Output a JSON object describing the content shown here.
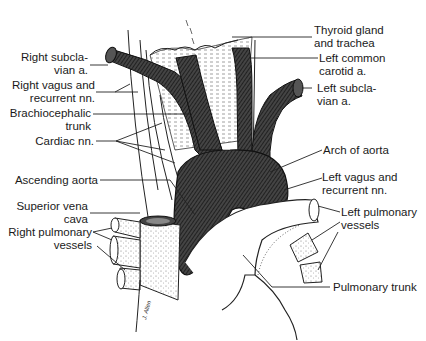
{
  "figure": {
    "colors": {
      "vessel_dark": "#3a3a3a",
      "vessel_hatch": "#1a1a1a",
      "line": "#222222",
      "background": "#ffffff",
      "stipple": "#555555"
    },
    "labels_left": [
      {
        "id": "right-subclavian",
        "lines": [
          "Right subcla-",
          "vian a."
        ]
      },
      {
        "id": "right-vagus",
        "lines": [
          "Right vagus and",
          "recurrent nn."
        ]
      },
      {
        "id": "brachiocephalic",
        "lines": [
          "Brachiocephalic",
          "trunk"
        ]
      },
      {
        "id": "cardiac",
        "lines": [
          "Cardiac nn."
        ]
      },
      {
        "id": "ascending-aorta",
        "lines": [
          "Ascending aorta"
        ]
      },
      {
        "id": "svc",
        "lines": [
          "Superior vena",
          "cava"
        ]
      },
      {
        "id": "right-pulmonary",
        "lines": [
          "Right pulmonary",
          "vessels"
        ]
      }
    ],
    "labels_right": [
      {
        "id": "thyroid",
        "lines": [
          "Thyroid gland",
          "and trachea"
        ]
      },
      {
        "id": "left-common-carotid",
        "lines": [
          "Left common",
          "carotid a."
        ]
      },
      {
        "id": "left-subclavian",
        "lines": [
          "Left subcla-",
          "vian a."
        ]
      },
      {
        "id": "arch",
        "lines": [
          "Arch of aorta"
        ]
      },
      {
        "id": "left-vagus",
        "lines": [
          "Left vagus and",
          "recurrent nn."
        ]
      },
      {
        "id": "left-pulmonary",
        "lines": [
          "Left pulmonary",
          "vessels"
        ]
      },
      {
        "id": "pulmonary-trunk",
        "lines": [
          "Pulmonary trunk"
        ]
      }
    ],
    "signature": "J. Allen"
  }
}
